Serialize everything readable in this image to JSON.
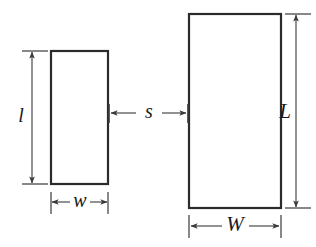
{
  "figure": {
    "background_color": "#ffffff",
    "stroke_color": "#2b2b2b",
    "dimension_color": "#3a3a3a",
    "label_color": "#1a1a1a",
    "width_px": 316,
    "height_px": 247
  },
  "shapes": {
    "small_rectangle": {
      "name": "small-rectangle",
      "x": 51,
      "y": 51,
      "width": 57,
      "height": 133,
      "stroke_width": 2.2
    },
    "large_rectangle": {
      "name": "large-rectangle",
      "x": 189,
      "y": 14,
      "width": 92,
      "height": 194,
      "stroke_width": 2.2
    }
  },
  "dimensions": [
    {
      "id": "l",
      "label": "l",
      "case": "lower",
      "orientation": "vertical",
      "describes": "small-rectangle-height",
      "axis_px": 32,
      "start_px": 51,
      "end_px": 184,
      "tick_from_px": 22,
      "tick_to_px": 48,
      "label_x": 31,
      "label_y": 117,
      "label_offset_x": -10,
      "arrowheads": "both"
    },
    {
      "id": "w",
      "label": "w",
      "case": "lower",
      "orientation": "horizontal",
      "describes": "small-rectangle-width",
      "axis_px": 202,
      "start_px": 51,
      "end_px": 108,
      "tick_from_px": 192,
      "tick_to_px": 214,
      "label_x": 80,
      "label_y": 202,
      "arrowheads": "both"
    },
    {
      "id": "s",
      "label": "s",
      "case": "lower",
      "orientation": "horizontal",
      "describes": "separation-between-rectangles",
      "axis_px": 113,
      "start_px": 109,
      "end_px": 188,
      "tick_from_px": 103,
      "tick_to_px": 124,
      "label_x": 149,
      "label_y": 113,
      "arrowheads": "outward"
    },
    {
      "id": "L",
      "label": "L",
      "case": "upper",
      "orientation": "vertical",
      "describes": "large-rectangle-height",
      "axis_px": 296,
      "start_px": 14,
      "end_px": 208,
      "tick_from_px": 285,
      "tick_to_px": 311,
      "label_x": 295,
      "label_y": 113,
      "label_offset_x": -10,
      "arrowheads": "both"
    },
    {
      "id": "W",
      "label": "W",
      "case": "upper",
      "orientation": "horizontal",
      "describes": "large-rectangle-width",
      "axis_px": 226,
      "start_px": 189,
      "end_px": 281,
      "tick_from_px": 215,
      "tick_to_px": 238,
      "label_x": 235,
      "label_y": 226,
      "arrowheads": "both"
    }
  ]
}
